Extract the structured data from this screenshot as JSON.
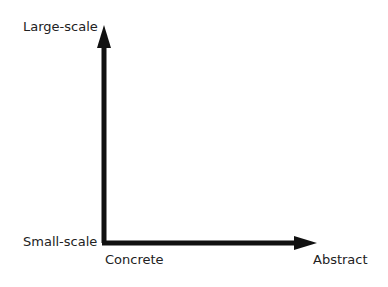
{
  "diagram": {
    "y_axis": {
      "top_label": "Large-scale",
      "bottom_label": "Small-scale"
    },
    "x_axis": {
      "left_label": "Concrete",
      "right_label": "Abstract"
    },
    "color": "#111111"
  }
}
